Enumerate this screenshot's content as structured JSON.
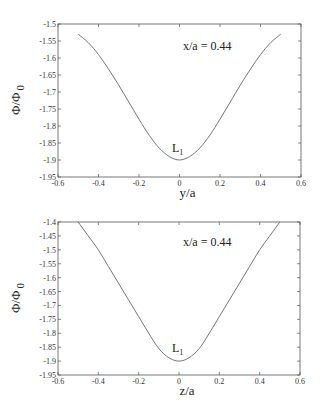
{
  "chart_data": [
    {
      "type": "line",
      "title": "",
      "xlabel": "y/a",
      "ylabel": "Φ/Φ 0",
      "annotations": [
        {
          "text": "x/a = 0.44"
        },
        {
          "text": "L1",
          "sub": "1",
          "base": "L",
          "x": 0,
          "y": -1.9
        }
      ],
      "xlim": [
        -0.6,
        0.6
      ],
      "ylim": [
        -1.95,
        -1.5
      ],
      "xticks": [
        -0.6,
        -0.4,
        -0.2,
        0,
        0.2,
        0.4,
        0.6
      ],
      "xtick_labels": [
        "-0.6",
        "-0.4",
        "-0.2",
        "0",
        "0.2",
        "0.4",
        "0.6"
      ],
      "yticks": [
        -1.5,
        -1.55,
        -1.6,
        -1.65,
        -1.7,
        -1.75,
        -1.8,
        -1.85,
        -1.9,
        -1.95
      ],
      "ytick_labels": [
        "-1.5",
        "-1.55",
        "-1.6",
        "-1.65",
        "-1.7",
        "-1.75",
        "-1.8",
        "-1.85",
        "-1.9",
        "-1.95"
      ],
      "grid": false,
      "series": [
        {
          "name": "L1",
          "x": [
            -0.5,
            -0.45,
            -0.4,
            -0.35,
            -0.3,
            -0.25,
            -0.2,
            -0.15,
            -0.1,
            -0.05,
            0,
            0.05,
            0.1,
            0.15,
            0.2,
            0.25,
            0.3,
            0.35,
            0.4,
            0.45,
            0.5
          ],
          "y": [
            -1.53,
            -1.555,
            -1.59,
            -1.633,
            -1.68,
            -1.73,
            -1.78,
            -1.827,
            -1.865,
            -1.89,
            -1.9,
            -1.89,
            -1.865,
            -1.827,
            -1.78,
            -1.73,
            -1.68,
            -1.633,
            -1.59,
            -1.555,
            -1.53
          ]
        }
      ]
    },
    {
      "type": "line",
      "title": "",
      "xlabel": "z/a",
      "ylabel": "Φ/Φ 0",
      "annotations": [
        {
          "text": "x/a = 0.44"
        },
        {
          "text": "L1",
          "sub": "1",
          "base": "L",
          "x": 0,
          "y": -1.9
        }
      ],
      "xlim": [
        -0.6,
        0.6
      ],
      "ylim": [
        -1.95,
        -1.4
      ],
      "xticks": [
        -0.6,
        -0.4,
        -0.2,
        0,
        0.2,
        0.4,
        0.6
      ],
      "xtick_labels": [
        "-0.6",
        "-0.4",
        "-0.2",
        "0",
        "0.2",
        "0.4",
        "0.6"
      ],
      "yticks": [
        -1.4,
        -1.45,
        -1.5,
        -1.55,
        -1.6,
        -1.65,
        -1.7,
        -1.75,
        -1.8,
        -1.85,
        -1.9,
        -1.95
      ],
      "ytick_labels": [
        "-1.4",
        "-1.45",
        "-1.5",
        "-1.55",
        "-1.6",
        "-1.65",
        "-1.7",
        "-1.75",
        "-1.8",
        "-1.85",
        "-1.9",
        "-1.95"
      ],
      "grid": false,
      "series": [
        {
          "name": "L1",
          "x": [
            -0.5,
            -0.45,
            -0.4,
            -0.35,
            -0.3,
            -0.25,
            -0.2,
            -0.15,
            -0.1,
            -0.05,
            0,
            0.05,
            0.1,
            0.15,
            0.2,
            0.25,
            0.3,
            0.35,
            0.4,
            0.45,
            0.5
          ],
          "y": [
            -1.4,
            -1.45,
            -1.5,
            -1.56,
            -1.62,
            -1.68,
            -1.74,
            -1.8,
            -1.855,
            -1.888,
            -1.9,
            -1.888,
            -1.855,
            -1.8,
            -1.74,
            -1.68,
            -1.62,
            -1.56,
            -1.5,
            -1.45,
            -1.4
          ]
        }
      ]
    }
  ],
  "labels": {
    "top_annotation": "x/a = 0.44",
    "top_xlabel": "y/a",
    "bottom_annotation": "x/a = 0.44",
    "bottom_xlabel": "z/a",
    "ylabel_main": "Φ/Φ",
    "ylabel_sub": "0",
    "l_base": "L",
    "l_sub": "1"
  }
}
